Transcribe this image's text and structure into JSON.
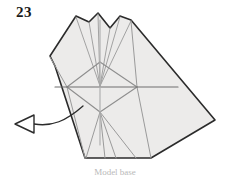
{
  "figure": {
    "step_number": "23",
    "caption_fragment": "Model base",
    "diagram_type": "origami-folding-step",
    "colors": {
      "paper_fill": "#ecebea",
      "outline": "#2b2b2b",
      "fold_line": "#8c8c8c",
      "crease_line": "#a8a8a8",
      "background": "#ffffff",
      "label_text": "#1a1a1a"
    },
    "shapes": {
      "paper_outline_name": "folded-paper-silhouette",
      "paper_outline_points": "98,13 89,22 76,16 50,56 55,66 85,158 151,158 215,120 131,20 120,16 110,28",
      "arrow_name": "fold-direction-arrow",
      "arrow_head_points": "15,124 34,115 34,133",
      "arrow_tail_path": "M 34 124 C 52 126, 66 122, 82 107"
    },
    "fold_lines": [
      {
        "name": "crease-left-outer",
        "x1": 89,
        "y1": 22,
        "x2": 100,
        "y2": 86
      },
      {
        "name": "crease-right-outer",
        "x1": 120,
        "y1": 17,
        "x2": 100,
        "y2": 86
      },
      {
        "name": "crease-apex-left",
        "x1": 98,
        "y1": 14,
        "x2": 100,
        "y2": 86
      },
      {
        "name": "crease-apex-right",
        "x1": 110,
        "y1": 28,
        "x2": 100,
        "y2": 86
      },
      {
        "name": "crease-left-fan",
        "x1": 76,
        "y1": 17,
        "x2": 100,
        "y2": 86
      },
      {
        "name": "crease-right-fan",
        "x1": 131,
        "y1": 21,
        "x2": 100,
        "y2": 86
      },
      {
        "name": "diamond-upper-left",
        "x1": 100,
        "y1": 62,
        "x2": 67,
        "y2": 87
      },
      {
        "name": "diamond-upper-right",
        "x1": 100,
        "y1": 62,
        "x2": 137,
        "y2": 87
      },
      {
        "name": "diamond-lower-left",
        "x1": 67,
        "y1": 87,
        "x2": 100,
        "y2": 112
      },
      {
        "name": "diamond-lower-right",
        "x1": 137,
        "y1": 87,
        "x2": 100,
        "y2": 112
      },
      {
        "name": "diamond-edge-top",
        "x1": 100,
        "y1": 62,
        "x2": 100,
        "y2": 86
      },
      {
        "name": "horizontal-spine",
        "x1": 55,
        "y1": 87,
        "x2": 178,
        "y2": 87
      },
      {
        "name": "vertical-spine",
        "x1": 100,
        "y1": 20,
        "x2": 100,
        "y2": 145
      },
      {
        "name": "lower-fan-left",
        "x1": 100,
        "y1": 112,
        "x2": 86,
        "y2": 158
      },
      {
        "name": "lower-fan-right",
        "x1": 100,
        "y1": 112,
        "x2": 136,
        "y2": 158
      },
      {
        "name": "lower-fan-mid-left",
        "x1": 100,
        "y1": 112,
        "x2": 105,
        "y2": 158
      },
      {
        "name": "lower-fan-mid-right",
        "x1": 100,
        "y1": 112,
        "x2": 116,
        "y2": 158
      },
      {
        "name": "left-panel-crease",
        "x1": 67,
        "y1": 87,
        "x2": 50,
        "y2": 57
      },
      {
        "name": "left-lower-crease",
        "x1": 67,
        "y1": 87,
        "x2": 85,
        "y2": 158
      },
      {
        "name": "right-upper-crease",
        "x1": 137,
        "y1": 87,
        "x2": 131,
        "y2": 21
      },
      {
        "name": "right-lower-crease",
        "x1": 137,
        "y1": 87,
        "x2": 151,
        "y2": 158
      }
    ]
  }
}
